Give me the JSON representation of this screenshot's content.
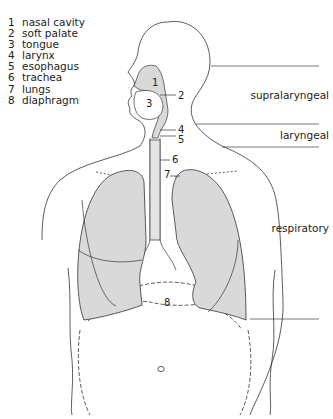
{
  "legend": [
    {
      "num": "1",
      "label": "nasal cavity"
    },
    {
      "num": "2",
      "label": "soft palate"
    },
    {
      "num": "3",
      "label": "tongue"
    },
    {
      "num": "4",
      "label": "larynx"
    },
    {
      "num": "5",
      "label": "esophagus"
    },
    {
      "num": "6",
      "label": "trachea"
    },
    {
      "num": "7",
      "label": "lungs"
    },
    {
      "num": "8",
      "label": "diaphragm"
    }
  ],
  "regions": {
    "supralaryngeal": "supralaryngeal",
    "laryngeal": "laryngeal",
    "respiratory": "respiratory"
  },
  "callouts": {
    "n1": "1",
    "n2": "2",
    "n3": "3",
    "n4": "4",
    "n5": "5",
    "n6": "6",
    "n7": "7",
    "n8": "8"
  },
  "colors": {
    "line": "#333333",
    "fill": "#d9d9d9"
  }
}
